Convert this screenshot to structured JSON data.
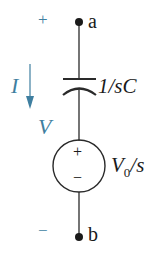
{
  "diagram": {
    "type": "s-domain circuit",
    "colors": {
      "wire": "#2a2a2a",
      "annotation": "#3f7fa0"
    },
    "terminals": {
      "top": {
        "label": "a",
        "polarity": "+"
      },
      "bottom": {
        "label": "b",
        "polarity": "−"
      }
    },
    "current": {
      "label": "I",
      "direction": "down"
    },
    "voltage": {
      "label": "V"
    },
    "capacitor": {
      "impedance_label": "1/sC"
    },
    "source": {
      "value_label": "V",
      "value_sub": "0",
      "value_suffix": "/s",
      "plus": "+",
      "minus": "−"
    }
  }
}
